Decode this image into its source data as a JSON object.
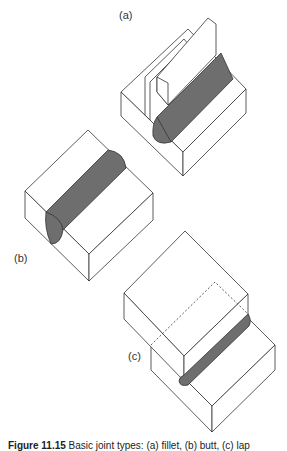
{
  "figure": {
    "labels": {
      "a": "(a)",
      "b": "(b)",
      "c": "(c)"
    },
    "caption": {
      "number": "Figure 11.15",
      "text": "Basic joint types: (a) fillet, (b) butt, (c) lap"
    },
    "colors": {
      "weld": "#6e6e6e",
      "line": "#333333",
      "background": "#ffffff"
    }
  }
}
